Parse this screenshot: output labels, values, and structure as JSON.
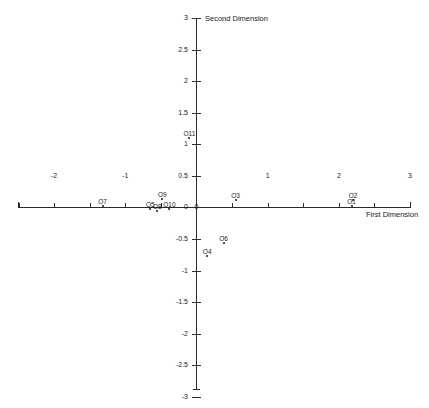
{
  "chart_data": {
    "type": "scatter",
    "title": "",
    "xlabel": "First Dimension",
    "ylabel": "Second Dimension",
    "xlim": [
      -3,
      3
    ],
    "ylim": [
      -3,
      3
    ],
    "grid": false,
    "legend": false,
    "x_ticks": [
      -3,
      -2.5,
      -2,
      -1.5,
      -1,
      -0.5,
      0,
      0.5,
      1,
      1.5,
      2,
      2.5,
      3
    ],
    "x_tick_labels": [
      "-3",
      "",
      "-2",
      "",
      "-1",
      "",
      "0",
      "",
      "1",
      "",
      "2",
      "",
      "3"
    ],
    "y_ticks": [
      -3,
      -2.5,
      -2,
      -1.5,
      -1,
      -0.5,
      0,
      0.5,
      1,
      1.5,
      2,
      2.5,
      3
    ],
    "y_tick_labels": [
      "-3",
      "-2.5",
      "-2",
      "-1.5",
      "-1",
      "-0.5",
      "0",
      "0.5",
      "1",
      "1.5",
      "2",
      "2.5",
      "3"
    ],
    "points": [
      {
        "label": "O1",
        "x": 2.18,
        "y": 0.02
      },
      {
        "label": "O2",
        "x": 2.2,
        "y": 0.12
      },
      {
        "label": "O3",
        "x": 0.55,
        "y": 0.12
      },
      {
        "label": "O4",
        "x": 0.15,
        "y": -0.76
      },
      {
        "label": "O5",
        "x": -0.65,
        "y": -0.03
      },
      {
        "label": "O6",
        "x": 0.38,
        "y": -0.56
      },
      {
        "label": "O7",
        "x": -1.32,
        "y": 0.03
      },
      {
        "label": "O8",
        "x": -0.55,
        "y": -0.06
      },
      {
        "label": "O9",
        "x": -0.48,
        "y": 0.13
      },
      {
        "label": "O10",
        "x": -0.38,
        "y": -0.02
      },
      {
        "label": "O11",
        "x": -0.1,
        "y": 1.1
      }
    ]
  }
}
